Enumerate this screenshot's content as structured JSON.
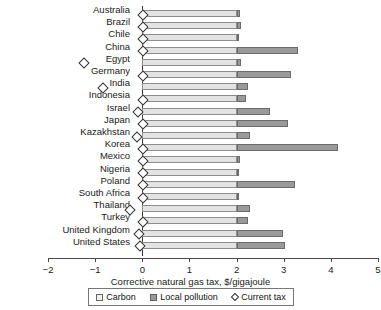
{
  "chart_data": {
    "type": "bar",
    "orientation": "horizontal",
    "stacked": true,
    "title": "",
    "xlabel": "Corrective natural gas tax, $/gigajoule",
    "ylabel": "",
    "xlim": [
      -2,
      5
    ],
    "xticks": [
      -2,
      -1,
      0,
      1,
      2,
      3,
      4,
      5
    ],
    "xtick_labels": [
      "−2",
      "−1",
      "0",
      "1",
      "2",
      "3",
      "4",
      "5"
    ],
    "grid": false,
    "legend_position": "bottom",
    "categories": [
      "Australia",
      "Brazil",
      "Chile",
      "China",
      "Egypt",
      "Germany",
      "India",
      "Indonesia",
      "Israel",
      "Japan",
      "Kazakhstan",
      "Korea",
      "Mexico",
      "Nigeria",
      "Poland",
      "South Africa",
      "Thailand",
      "Turkey",
      "United Kingdom",
      "United States"
    ],
    "series": [
      {
        "name": "Carbon",
        "color": "#e3e3e3",
        "values": [
          2.0,
          2.0,
          2.0,
          2.0,
          2.0,
          2.0,
          2.0,
          2.0,
          2.0,
          2.0,
          2.0,
          2.0,
          2.0,
          2.0,
          2.0,
          2.0,
          2.0,
          2.0,
          2.0,
          2.0
        ]
      },
      {
        "name": "Local pollution",
        "color": "#9a9a9a",
        "values": [
          0.08,
          0.1,
          0.06,
          1.3,
          0.1,
          1.15,
          0.24,
          0.2,
          0.7,
          1.1,
          0.28,
          2.15,
          0.07,
          0.03,
          1.25,
          0.03,
          0.28,
          0.24,
          0.99,
          1.03
        ]
      },
      {
        "name": "Current tax",
        "type": "marker",
        "marker": "diamond",
        "color": "#ffffff",
        "values": [
          0.0,
          0.0,
          0.0,
          0.0,
          -1.25,
          0.0,
          -0.86,
          0.0,
          -0.11,
          0.0,
          -0.13,
          0.0,
          0.0,
          0.0,
          0.0,
          0.0,
          -0.28,
          0.0,
          -0.09,
          -0.07
        ]
      }
    ],
    "legend": [
      "Carbon",
      "Local pollution",
      "Current tax"
    ]
  }
}
